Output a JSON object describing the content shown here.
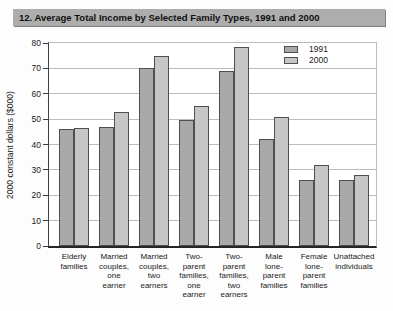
{
  "chart_data": {
    "type": "bar",
    "title": "12. Average Total Income by Selected Family Types, 1991 and 2000",
    "ylabel": "2000 constant dollars ($000)",
    "xlabel": "",
    "ylim": [
      0,
      80
    ],
    "yticks": [
      0,
      10,
      20,
      30,
      40,
      50,
      60,
      70,
      80
    ],
    "grid": true,
    "legend_position": "top-right",
    "categories": [
      "Elderly families",
      "Married couples, one earner",
      "Married couples, two earners",
      "Two-parent families, one earner",
      "Two-parent families, two earners",
      "Male lone-parent families",
      "Female lone-parent families",
      "Unattached individuals"
    ],
    "category_label_lines": [
      [
        "Elderly",
        "families"
      ],
      [
        "Married",
        "couples,",
        "one",
        "earner"
      ],
      [
        "Married",
        "couples,",
        "two",
        "earners"
      ],
      [
        "Two-",
        "parent",
        "families,",
        "one",
        "earner"
      ],
      [
        "Two-",
        "parent",
        "families,",
        "two",
        "earners"
      ],
      [
        "Male",
        "lone-",
        "parent",
        "families"
      ],
      [
        "Female",
        "lone-",
        "parent",
        "families"
      ],
      [
        "Unattached",
        "individuals"
      ]
    ],
    "series": [
      {
        "name": "1991",
        "values": [
          46,
          47,
          70,
          49.5,
          69,
          42,
          26,
          26
        ],
        "color": "#a9a9a9"
      },
      {
        "name": "2000",
        "values": [
          46.5,
          53,
          75,
          55,
          78.5,
          51,
          32,
          28
        ],
        "color": "#c6c6c6"
      }
    ]
  },
  "colors": {
    "title_bg": "#adadad",
    "title_text": "#101010",
    "gridline": "#bcbcbc",
    "plot_right_border": "#bcbcbc",
    "y_axis_line": "#3f3f3f",
    "x_axis_line": "#262626",
    "bar_border": "#4f4f4f",
    "text": "#1a1a1a"
  }
}
